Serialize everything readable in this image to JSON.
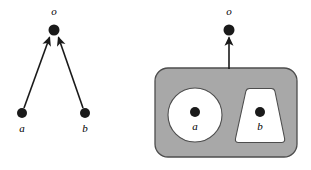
{
  "figure": {
    "caption": "",
    "background_color": "#ffffff",
    "width": 311,
    "height": 170
  },
  "colors": {
    "node_fill": "#1a1a1a",
    "edge_stroke": "#1a1a1a",
    "container_fill": "#a8a8a8",
    "container_stroke": "#4d4d4d",
    "part_fill": "#ffffff",
    "part_stroke": "#4d4d4d",
    "label_color": "#000000",
    "background": "#ffffff"
  },
  "left_panel": {
    "name": "two-arrow-diagram",
    "nodes": [
      {
        "id": "o",
        "label": "o",
        "cx": 54,
        "cy": 30,
        "r": 5.5,
        "label_x": 54,
        "label_y": 15
      },
      {
        "id": "a",
        "label": "a",
        "cx": 22,
        "cy": 113,
        "r": 5.0,
        "label_x": 22,
        "label_y": 132
      },
      {
        "id": "b",
        "label": "b",
        "cx": 85,
        "cy": 113,
        "r": 5.0,
        "label_x": 85,
        "label_y": 132
      }
    ],
    "edges": [
      {
        "id": "a-to-o",
        "from": "a",
        "to": "o",
        "x1": 24,
        "y1": 108,
        "x2": 49,
        "y2": 36
      },
      {
        "id": "b-to-o",
        "from": "b",
        "to": "o",
        "x1": 83,
        "y1": 108,
        "x2": 59,
        "y2": 36
      }
    ]
  },
  "right_panel": {
    "name": "container-diagram",
    "container": {
      "id": "whole",
      "x": 155,
      "y": 68,
      "width": 142,
      "height": 89,
      "rx": 13
    },
    "parts": [
      {
        "id": "a",
        "shape": "circle",
        "label": "a",
        "cx": 195,
        "cy": 115,
        "r": 27,
        "node_cx": 195,
        "node_cy": 112,
        "node_r": 5.0,
        "label_x": 195,
        "label_y": 130
      },
      {
        "id": "b",
        "shape": "trapezoid",
        "label": "b",
        "node_cx": 260,
        "node_cy": 112,
        "node_r": 5.0,
        "label_x": 260,
        "label_y": 130
      }
    ],
    "nodes": [
      {
        "id": "o",
        "label": "o",
        "cx": 229,
        "cy": 30,
        "r": 5.5,
        "label_x": 229,
        "label_y": 15
      }
    ],
    "edges": [
      {
        "id": "whole-to-o",
        "from": "whole",
        "to": "o",
        "x1": 229,
        "y1": 69,
        "x2": 229,
        "y2": 36
      }
    ]
  }
}
